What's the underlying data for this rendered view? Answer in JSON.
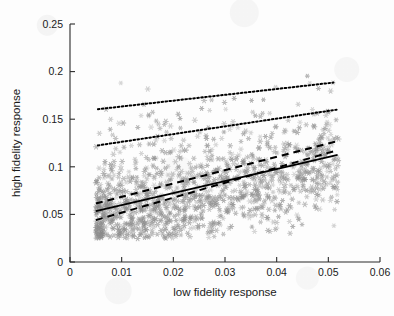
{
  "chart_data": {
    "type": "scatter",
    "title": "",
    "xlabel": "low fidelity response",
    "ylabel": "high fidelity response",
    "xlim": [
      0,
      0.06
    ],
    "ylim": [
      0,
      0.25
    ],
    "xticks": [
      0,
      0.01,
      0.02,
      0.03,
      0.04,
      0.05,
      0.06
    ],
    "xticklabels": [
      "0",
      "0.01",
      "0.02",
      "0.03",
      "0.04",
      "0.05",
      "0.06"
    ],
    "yticks": [
      0,
      0.05,
      0.1,
      0.15,
      0.2,
      0.25
    ],
    "yticklabels": [
      "0",
      "0.05",
      "0.1",
      "0.15",
      "0.2",
      "0.25"
    ],
    "grid": false,
    "legend": "none",
    "marker": "asterisk",
    "marker_color": "#8c8c8c",
    "point_count": 1400,
    "scatter_cloud": {
      "x_range": [
        0.005,
        0.052
      ],
      "y_range": [
        0.025,
        0.195
      ],
      "x_mean": 0.023,
      "y_mean": 0.085,
      "x_std": 0.01,
      "y_std": 0.03,
      "correlation": 0.42,
      "description": "dense elongated cloud of gray asterisk markers, densest between x 0.008-0.035 and y 0.04-0.11, thinning upward toward y 0.20 and rightward toward x 0.052"
    },
    "series": [
      {
        "name": "regression fit",
        "style": "solid",
        "color": "#000000",
        "x": [
          0.005,
          0.0518
        ],
        "y": [
          0.0535,
          0.1125
        ]
      },
      {
        "name": "prediction interval upper",
        "style": "dashed",
        "color": "#000000",
        "x": [
          0.005,
          0.0518
        ],
        "y": [
          0.0615,
          0.127
        ]
      },
      {
        "name": "prediction interval lower",
        "style": "dashed",
        "color": "#000000",
        "x": [
          0.005,
          0.0518
        ],
        "y": [
          0.044,
          0.1175
        ]
      },
      {
        "name": "outer band upper",
        "style": "dotted",
        "color": "#000000",
        "x": [
          0.0054,
          0.051
        ],
        "y": [
          0.1605,
          0.1885
        ]
      },
      {
        "name": "outer band lower",
        "style": "dotted",
        "color": "#000000",
        "x": [
          0.0054,
          0.0516
        ],
        "y": [
          0.1225,
          0.16
        ]
      }
    ]
  },
  "axes": {
    "x_title": "low fidelity response",
    "y_title": "high fidelity response"
  }
}
